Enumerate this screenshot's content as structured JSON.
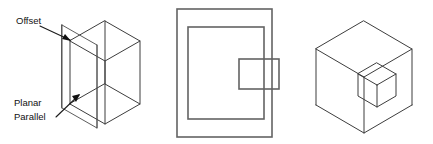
{
  "figure": {
    "background_color": "#ffffff",
    "line_color": "#3d3d3d",
    "ortho_line_color": "#636363",
    "label_color": "#111111",
    "panels": [
      {
        "name": "isometric-offset-plane",
        "description": "Isometric wireframe cube intersected by a vertical planar face",
        "labels": [
          {
            "id": "offset",
            "text": "Offset"
          },
          {
            "id": "planar-line-1",
            "text": "Planar"
          },
          {
            "id": "planar-line-2",
            "text": "Parallel"
          }
        ]
      },
      {
        "name": "orthographic-front-view",
        "description": "Front orthographic view: outer rectangle, inner rectangle, small overlapping rectangle on right edge"
      },
      {
        "name": "isometric-pocket-cube",
        "description": "Isometric wireframe cube containing a small isometric cube pocket"
      }
    ]
  }
}
